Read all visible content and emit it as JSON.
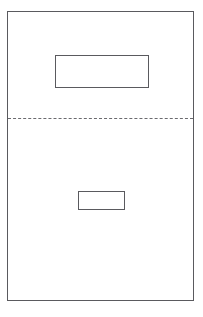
{
  "document": {
    "title": "Page Layout Diagram",
    "background_color": "#ffffff",
    "width": 203,
    "height": 317
  },
  "page_frame": {
    "name": "page-border",
    "label": "",
    "stroke_color": "#5a5a5e",
    "stroke_width": 1,
    "x": 7,
    "y": 11,
    "width": 187,
    "height": 290
  },
  "shapes": [
    {
      "name": "upper-rectangle",
      "label": "",
      "type": "rectangle",
      "stroke_color": "#5a5a5e",
      "stroke_width": 1.5,
      "fill": "#ffffff",
      "x": 54,
      "y": 54,
      "width": 94,
      "height": 33
    },
    {
      "name": "lower-rectangle",
      "label": "",
      "type": "rectangle",
      "stroke_color": "#5a5a5e",
      "stroke_width": 1.5,
      "fill": "#ffffff",
      "x": 77,
      "y": 190,
      "width": 47,
      "height": 19
    }
  ],
  "divider": {
    "name": "dashed-divider-line",
    "label": "",
    "type": "dashed-horizontal-line",
    "stroke_color": "#6a6a6e",
    "stroke_width": 1.5,
    "dash_length": 10,
    "gap_length": 5,
    "x": 8,
    "y": 118,
    "width": 186
  }
}
